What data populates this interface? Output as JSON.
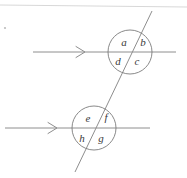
{
  "figure": {
    "bullet_mark": ".",
    "colors": {
      "line": "#8e8e8e",
      "circle": "#7c7c7c",
      "label": "#3a3a3a",
      "top_rule": "#d8d8d8",
      "background": "#ffffff"
    },
    "top_rule": {
      "x1": 0,
      "y1": 5,
      "x2": 187,
      "y2": 7
    },
    "transversal": {
      "x1": 152,
      "y1": 11,
      "x2": 75,
      "y2": 172
    },
    "parallel_lines": [
      {
        "name": "upper-parallel-line",
        "x1": 33,
        "y1": 52,
        "x2": 176,
        "y2": 52,
        "arrow_x": 84,
        "arrow_y": 52
      },
      {
        "name": "lower-parallel-line",
        "x1": 5,
        "y1": 128,
        "x2": 150,
        "y2": 128,
        "arrow_x": 57,
        "arrow_y": 128
      }
    ],
    "intersections": [
      {
        "name": "upper-intersection",
        "cx": 130,
        "cy": 52,
        "r": 22,
        "labels": [
          {
            "id": "a",
            "text": "a",
            "x": 124,
            "y": 43
          },
          {
            "id": "b",
            "text": "b",
            "x": 143,
            "y": 43
          },
          {
            "id": "c",
            "text": "c",
            "x": 137,
            "y": 62
          },
          {
            "id": "d",
            "text": "d",
            "x": 118,
            "y": 62
          }
        ]
      },
      {
        "name": "lower-intersection",
        "cx": 94,
        "cy": 128,
        "r": 22,
        "labels": [
          {
            "id": "e",
            "text": "e",
            "x": 88,
            "y": 119
          },
          {
            "id": "f",
            "text": "f",
            "x": 106,
            "y": 118
          },
          {
            "id": "g",
            "text": "g",
            "x": 101,
            "y": 139
          },
          {
            "id": "h",
            "text": "h",
            "x": 82,
            "y": 139
          }
        ]
      }
    ]
  }
}
